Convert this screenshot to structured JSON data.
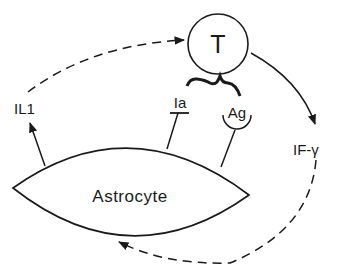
{
  "diagram": {
    "nodes": {
      "t_cell": {
        "label": "T"
      },
      "astrocyte": {
        "label": "Astrocyte"
      }
    },
    "labels": {
      "il1": "IL1",
      "ia": "Ia",
      "ag": "Ag",
      "ifg": "IF-γ"
    },
    "edges": [
      {
        "from": "astrocyte",
        "to": "IL1",
        "style": "solid"
      },
      {
        "from": "IL1",
        "to": "T",
        "style": "dashed"
      },
      {
        "from": "T",
        "to": "IF-γ",
        "style": "solid"
      },
      {
        "from": "IF-γ",
        "to": "astrocyte",
        "style": "dashed"
      },
      {
        "from": "astrocyte",
        "to": "Ia",
        "style": "solid"
      },
      {
        "from": "astrocyte",
        "to": "Ag",
        "style": "solid"
      }
    ],
    "colors": {
      "stroke": "#1a1a1a",
      "background": "#ffffff"
    }
  }
}
